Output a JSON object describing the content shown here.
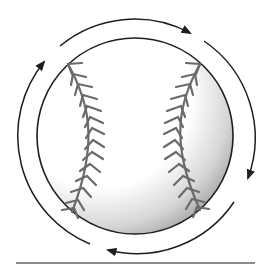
{
  "figure": {
    "colors": {
      "outline": "#1e1e1e",
      "stitch": "#6a6a6a",
      "shade": "#9a9a9a",
      "rule": "#8c8c8c",
      "background": "#ffffff"
    },
    "ball": {
      "cx": 135,
      "cy": 136,
      "r": 98
    },
    "spin_arrows": {
      "radius": 117,
      "direction": "clockwise",
      "count": 4
    }
  }
}
